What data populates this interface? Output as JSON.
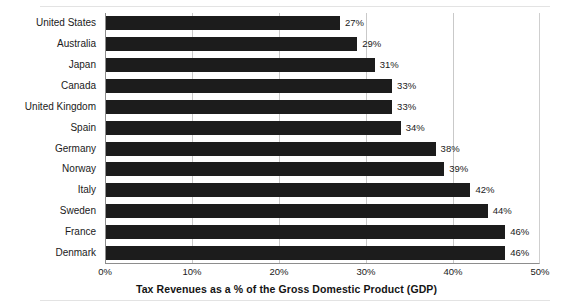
{
  "chart_data": {
    "type": "bar",
    "orientation": "horizontal",
    "title": "",
    "xlabel": "Tax Revenues as a % of the Gross Domestic Product (GDP)",
    "ylabel": "",
    "xlim": [
      0,
      50
    ],
    "xticks": [
      "0%",
      "10%",
      "20%",
      "30%",
      "40%",
      "50%"
    ],
    "xtick_values": [
      0,
      10,
      20,
      30,
      40,
      50
    ],
    "grid": "vertical",
    "legend": "none",
    "bar_color": "#1c1c1c",
    "categories": [
      "United States",
      "Australia",
      "Japan",
      "Canada",
      "United Kingdom",
      "Spain",
      "Germany",
      "Norway",
      "Italy",
      "Sweden",
      "France",
      "Denmark"
    ],
    "values": [
      27,
      29,
      31,
      33,
      33,
      34,
      38,
      39,
      42,
      44,
      46,
      46
    ],
    "data_labels": [
      "27%",
      "29%",
      "31%",
      "33%",
      "33%",
      "34%",
      "38%",
      "39%",
      "42%",
      "44%",
      "46%",
      "46%"
    ]
  }
}
